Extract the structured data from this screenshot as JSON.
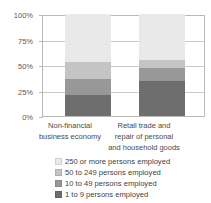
{
  "chart_data": {
    "type": "bar",
    "stacked": true,
    "stack_mode": "percent",
    "title": "",
    "xlabel": "",
    "ylabel": "",
    "ylim": [
      0,
      100
    ],
    "yticks": [
      0,
      25,
      50,
      75,
      100
    ],
    "ytick_labels": [
      "0%",
      "25%",
      "50%",
      "75%",
      "100%"
    ],
    "grid": true,
    "legend_position": "bottom",
    "categories": [
      "Non-financial business economy",
      "Retail trade and repair of personal and household goods"
    ],
    "category_lines": [
      [
        "Non-financial",
        "business economy"
      ],
      [
        "Retail trade and",
        "repair of personal",
        "and household goods"
      ]
    ],
    "series": [
      {
        "name": "1 to 9 persons employed",
        "color": "#6e6e6e",
        "values": [
          21,
          34
        ]
      },
      {
        "name": "10 to 49 persons employed",
        "color": "#989898",
        "values": [
          15,
          13
        ]
      },
      {
        "name": "50 to 249 persons employed",
        "color": "#c4c4c4",
        "values": [
          17,
          8
        ]
      },
      {
        "name": "250 or more persons employed",
        "color": "#e9e9e9",
        "values": [
          47,
          45
        ]
      }
    ],
    "legend_order": [
      "250 or more persons employed",
      "50 to 249 persons employed",
      "10 to 49 persons employed",
      "1 to 9 persons employed"
    ]
  },
  "colors": {
    "axis": "#b9b9b9",
    "grid": "#c9c9c9",
    "text": "#3f3f3f",
    "background": "#ffffff"
  }
}
